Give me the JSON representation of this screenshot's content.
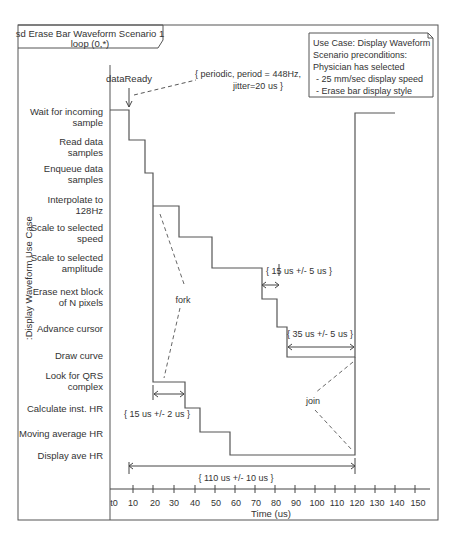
{
  "frame": {
    "title_line1": "sd Erase Bar Waveform Scenario 1",
    "title_line2": "loop (0,*)"
  },
  "lifeline": ":Display Waveform Use Case",
  "note": {
    "lines": [
      "Use Case: Display Waveform",
      "Scenario preconditions:",
      "Physician has selected",
      " - 25 mm/sec display speed",
      " - Erase bar display style"
    ]
  },
  "event": {
    "label": "dataReady",
    "constraint_line1": "{ periodic, period = 448Hz,",
    "constraint_line2": "jitter=20 us }"
  },
  "states": [
    {
      "line1": "Wait for incoming",
      "line2": "sample"
    },
    {
      "line1": "Read data",
      "line2": "samples"
    },
    {
      "line1": "Enqueue data",
      "line2": "samples"
    },
    {
      "line1": "Interpolate to",
      "line2": "128Hz"
    },
    {
      "line1": "Scale to selected",
      "line2": "speed"
    },
    {
      "line1": "Scale to selected",
      "line2": "amplitude"
    },
    {
      "line1": "Erase next block",
      "line2": "of N pixels"
    },
    {
      "line1": "Advance cursor",
      "line2": ""
    },
    {
      "line1": "Draw curve",
      "line2": ""
    },
    {
      "line1": "Look for QRS",
      "line2": "complex"
    },
    {
      "line1": "Calculate inst. HR",
      "line2": ""
    },
    {
      "line1": "Moving average HR",
      "line2": ""
    },
    {
      "line1": "Display ave HR",
      "line2": ""
    }
  ],
  "annotations": {
    "fork": "fork",
    "join": "join",
    "c_qrs": "{ 15 us +/- 2 us }",
    "c_scale": "{ 15 us +/- 5 us }",
    "c_draw": "{ 35 us +/- 5 us }",
    "c_total": "{ 110 us +/- 10 us }"
  },
  "axis": {
    "label": "Time (us)",
    "ticks": [
      "t0",
      "10",
      "20",
      "30",
      "40",
      "50",
      "60",
      "70",
      "80",
      "90",
      "100",
      "110",
      "120",
      "130",
      "140",
      "150"
    ]
  }
}
